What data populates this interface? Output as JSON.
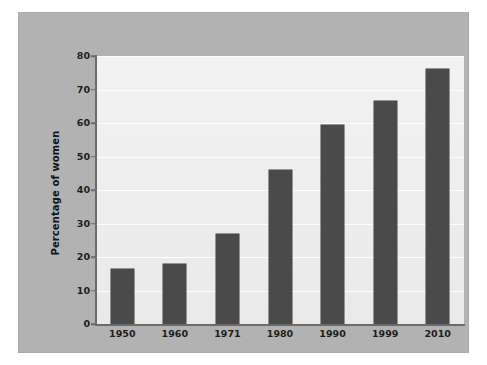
{
  "chart_data": {
    "type": "bar",
    "title": "",
    "subtitle": "",
    "xlabel": "",
    "ylabel": "Percentage of women",
    "categories": [
      "1950",
      "1960",
      "1971",
      "1980",
      "1990",
      "1999",
      "2010"
    ],
    "values": [
      16.5,
      18,
      27,
      46,
      59.5,
      66.5,
      76
    ],
    "series": [
      {
        "name": "Percentage of women",
        "values": [
          16.5,
          18,
          27,
          46,
          59.5,
          66.5,
          76
        ]
      }
    ],
    "ylim": [
      0,
      80
    ],
    "yticks": [
      0,
      10,
      20,
      30,
      40,
      50,
      60,
      70,
      80
    ],
    "ytick_labels": [
      "0",
      "10",
      "20",
      "30",
      "40",
      "50",
      "60",
      "70",
      "80"
    ],
    "xtick_labels": [
      "1950",
      "1960",
      "1971",
      "1980",
      "1990",
      "1999",
      "2010"
    ],
    "grid": "horizontal",
    "legend": "none",
    "annotations": [],
    "colors": {
      "bar": "#4a4a4a",
      "plot_background": "#ededed",
      "panel_background": "#b2b2b2",
      "gridline": "#fdfdfd",
      "axis": "#6b6b6b",
      "text": "#1d1d1d",
      "page_background": "#ffffff"
    }
  }
}
